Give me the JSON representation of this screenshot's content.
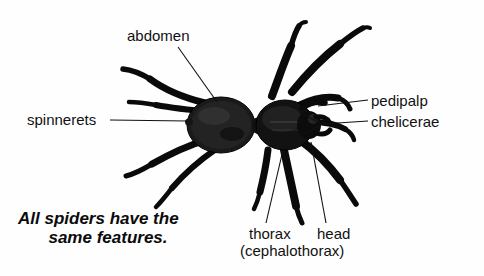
{
  "figure": {
    "background_color": "#fefefe",
    "ink_color": "#111111",
    "width": 484,
    "height": 276
  },
  "labels": {
    "abdomen": "abdomen",
    "spinnerets": "spinnerets",
    "pedipalp": "pedipalp",
    "chelicerae": "chelicerae",
    "thorax": "thorax",
    "cephalothorax": "(cephalothorax)",
    "head": "head"
  },
  "caption": {
    "line1": "All spiders have the",
    "line2": "same features."
  },
  "subject": {
    "name": "spider",
    "body_parts": [
      "abdomen",
      "cephalothorax",
      "head",
      "chelicerae",
      "pedipalp",
      "spinnerets",
      "legs"
    ],
    "leg_count": 8
  }
}
